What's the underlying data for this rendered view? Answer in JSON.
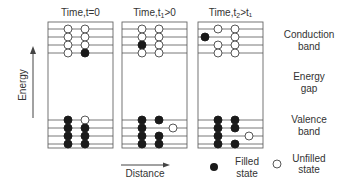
{
  "axis": {
    "energy_label": "Energy",
    "distance_label": "Distance"
  },
  "panels": [
    {
      "title_main": "Time,t=0",
      "title_sub": "",
      "title_tail": "",
      "conduction": [
        [
          "empty",
          "empty"
        ],
        [
          "empty",
          "empty"
        ],
        [
          "empty",
          "empty"
        ],
        [
          "empty",
          "filled"
        ]
      ],
      "valence": [
        [
          "filled",
          "empty"
        ],
        [
          "filled",
          "filled"
        ],
        [
          "filled",
          "filled"
        ],
        [
          "filled",
          "filled"
        ]
      ]
    },
    {
      "title_main": "Time,t",
      "title_sub": "1",
      "title_tail": ">0",
      "conduction": [
        [
          "empty",
          "empty"
        ],
        [
          "empty",
          "empty"
        ],
        [
          "filled",
          "empty"
        ],
        [
          "empty",
          "empty"
        ]
      ],
      "valence": [
        [
          "filled",
          "filled"
        ],
        [
          "filled",
          "none",
          "empty-right"
        ],
        [
          "filled",
          "filled"
        ],
        [
          "filled",
          "filled"
        ]
      ]
    },
    {
      "title_main": "Time,t",
      "title_sub": "2",
      "title_tail": ">t₁",
      "conduction": [
        [
          "empty",
          "empty"
        ],
        [
          "filled-left",
          "empty"
        ],
        [
          "empty",
          "empty"
        ],
        [
          "empty",
          "empty"
        ]
      ],
      "valence": [
        [
          "filled",
          "filled"
        ],
        [
          "filled",
          "filled"
        ],
        [
          "filled",
          "none",
          "empty-right"
        ],
        [
          "filled",
          "filled"
        ]
      ]
    }
  ],
  "band_labels": {
    "conduction": [
      "Conduction",
      "band"
    ],
    "gap": [
      "Energy",
      "gap"
    ],
    "valence": [
      "Valence",
      "band"
    ]
  },
  "legend": {
    "filled": [
      "Filled",
      "state"
    ],
    "unfilled": [
      "Unfilled",
      "state"
    ]
  },
  "colors": {
    "filled": "#1a1a1a",
    "line": "#555555",
    "empty": "#ffffff"
  }
}
